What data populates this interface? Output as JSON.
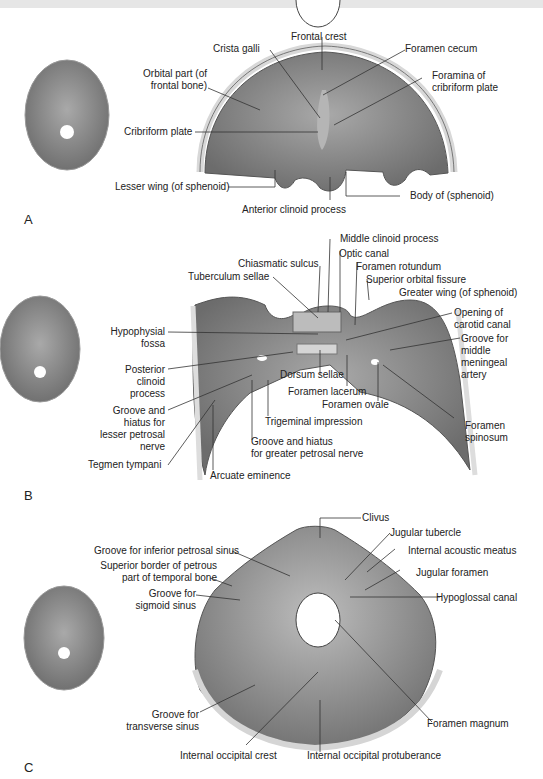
{
  "figure": {
    "panels": [
      {
        "letter": "A",
        "labels": {
          "frontal_crest": "Frontal crest",
          "crista_galli": "Crista galli",
          "foramen_cecum": "Foramen cecum",
          "orbital_part_1": "Orbital part (of",
          "orbital_part_2": "frontal bone)",
          "foramina_1": "Foramina of",
          "foramina_2": "cribriform plate",
          "cribriform_plate": "Cribriform plate",
          "lesser_wing": "Lesser wing (of sphenoid)",
          "body_sphenoid": "Body of (sphenoid)",
          "anterior_clinoid": "Anterior clinoid process"
        }
      },
      {
        "letter": "B",
        "labels": {
          "middle_clinoid": "Middle clinoid process",
          "optic_canal": "Optic canal",
          "chiasmatic_sulcus": "Chiasmatic sulcus",
          "foramen_rotundum": "Foramen rotundum",
          "tuberculum_sellae": "Tuberculum sellae",
          "superior_orbital_fissure": "Superior orbital fissure",
          "greater_wing": "Greater wing (of sphenoid)",
          "hypophysial_1": "Hypophysial",
          "hypophysial_2": "fossa",
          "carotid_1": "Opening of",
          "carotid_2": "carotid canal",
          "mma_1": "Groove for",
          "mma_2": "middle",
          "mma_3": "meningeal",
          "mma_4": "artery",
          "post_clinoid_1": "Posterior",
          "post_clinoid_2": "clinoid",
          "post_clinoid_3": "process",
          "dorsum_sellae": "Dorsum sellae",
          "foramen_lacerum": "Foramen lacerum",
          "foramen_ovale": "Foramen ovale",
          "lesser_petrosal_1": "Groove and",
          "lesser_petrosal_2": "hiatus for",
          "lesser_petrosal_3": "lesser petrosal",
          "lesser_petrosal_4": "nerve",
          "trigeminal": "Trigeminal impression",
          "foramen_spinosum_1": "Foramen",
          "foramen_spinosum_2": "spinosum",
          "greater_petrosal_1": "Groove and hiatus",
          "greater_petrosal_2": "for greater petrosal nerve",
          "tegmen": "Tegmen tympani",
          "arcuate": "Arcuate eminence"
        }
      },
      {
        "letter": "C",
        "labels": {
          "clivus": "Clivus",
          "jugular_tubercle": "Jugular tubercle",
          "inferior_petrosal": "Groove for inferior petrosal sinus",
          "internal_acoustic": "Internal acoustic meatus",
          "superior_border_1": "Superior border of petrous",
          "superior_border_2": "part of temporal bone",
          "jugular_foramen": "Jugular foramen",
          "sigmoid_1": "Groove for",
          "sigmoid_2": "sigmoid sinus",
          "hypoglossal": "Hypoglossal canal",
          "transverse_1": "Groove for",
          "transverse_2": "transverse sinus",
          "foramen_magnum": "Foramen magnum",
          "int_occ_crest": "Internal occipital crest",
          "int_occ_protub": "Internal occipital protuberance"
        }
      }
    ],
    "colors": {
      "bone_dark": "#6e6e6e",
      "bone_mid": "#8f8f8f",
      "bone_light": "#c8c8c8",
      "rim": "#e2e2e2",
      "line": "#333333"
    }
  }
}
